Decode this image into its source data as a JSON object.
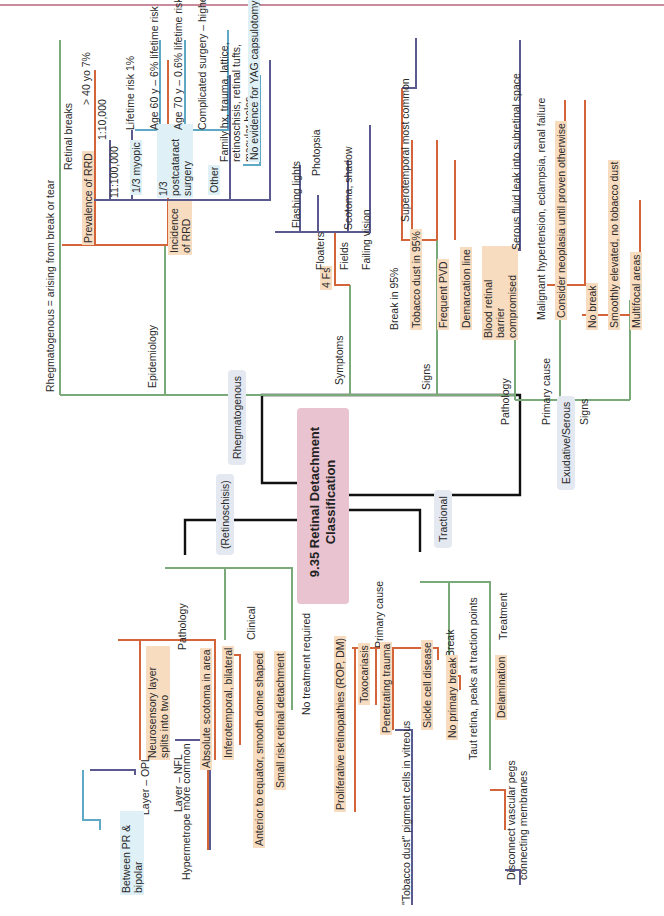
{
  "title": "9.35 Retinal Detachment Classification",
  "colors": {
    "center_fill": "#e9c3cf",
    "green": "#7aa97a",
    "orange": "#d4643a",
    "purple": "#5b5a8f",
    "blue": "#5fa9c4",
    "highlight_orange": "#f8dcc0",
    "highlight_blue": "#dff0f6",
    "pill": "#e4e8f1"
  },
  "branches": {
    "rhegmatogenous": {
      "label": "Rhegmatogenous",
      "definition": "Rhegmatogenous = arising from break or tear",
      "epidemiology": {
        "label": "Epidemiology",
        "retinal_breaks": "Retinal breaks",
        "retinal_breaks_value": "> 40 yo 7%",
        "prevalence": "Prevalence of RRD",
        "prevalence_value": "1:10,000",
        "incidence": "Incidence of RRD",
        "incidence_value": "11:100,000",
        "myopic": "1/3 myopic",
        "postcataract": "1/3 postcataract surgery",
        "lifetime_risk": "Lifetime risk 1%",
        "age60": "Age 60 y – 6% lifetime risk",
        "age70": "Age 70 y – 0.6% lifetime risk",
        "complicated": "Complicated surgery – higher risk",
        "other": "Other",
        "family": "Family hx, trauma, lattice, retinoschisis, retinal tufts, macular holes",
        "yag": "No evidence for YAG capsulotomy"
      },
      "symptoms": {
        "label": "Symptoms",
        "four_fs": "4 Fs",
        "flashing": "Flashing lights",
        "photopsia": "Photopsia",
        "floaters": "Floaters",
        "fields": "Fields",
        "scotoma": "Scotoma, shadow",
        "failing": "Failing vision"
      },
      "signs": {
        "label": "Signs",
        "break95": "Break in 95%",
        "superotemporal": "Superotemporal most common",
        "tobacco95": "Tobacco dust in 95%",
        "pvd": "Frequent PVD",
        "demarcation": "Demarcation line"
      }
    },
    "exudative": {
      "label": "Exudative/Serous",
      "pathology": "Pathology",
      "brb": "Blood retinal barrier compromised",
      "serous": "Serous fluid leak into subretinal space",
      "primary_cause": "Primary cause",
      "malignant": "Malignant hypertension, eclampsia, renal failure",
      "neoplasia": "Consider neoplasia until proven otherwise",
      "signs": "Signs",
      "no_break": "No break",
      "smoothly": "Smoothly elevated, no tobacco dust",
      "multifocal": "Multifocal areas"
    },
    "retinoschisis": {
      "label": "(Retinoschisis)",
      "pathology": "Pathology",
      "neurosensory": "Neurosensory layer splits into two",
      "layer_opl": "Layer – OPL",
      "between": "Between PR & bipolar",
      "layer_nfl": "Layer – NFL",
      "absolute": "Absolute scotoma in area",
      "clinical": "Clinical",
      "inferotemporal": "Inferotemporal, bilateral",
      "hypermetrope": "Hypermetrope more common",
      "anterior": "Anterior to equator, smooth dome shaped",
      "small_risk": "Small risk retinal detachment",
      "no_treatment": "No treatment required"
    },
    "tractional": {
      "label": "Tractional",
      "primary_cause": "Primary cause",
      "proliferative": "Proliferative retinopathies (ROP, DM)",
      "toxocariasis": "Toxocariasis",
      "penetrating": "Penetrating trauma",
      "tobacco_dust": "\"Tobacco dust\" pigment cells in vitreous",
      "sickle": "Sickle cell disease",
      "break": "Break",
      "no_primary": "No primary break",
      "taut": "Taut retina, peaks at traction points",
      "treatment": "Treatment",
      "delamination": "Delamination",
      "disconnect": "Disconnect vascular pegs connecting membranes"
    }
  }
}
